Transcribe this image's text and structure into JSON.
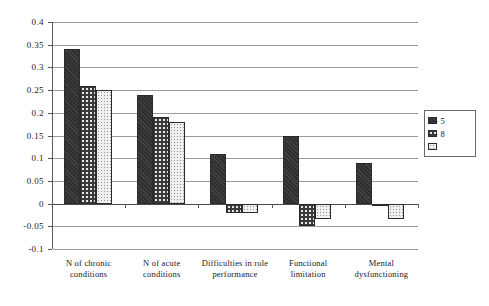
{
  "chart_data": {
    "type": "bar",
    "title": "",
    "subtitle": "",
    "xlabel": "",
    "ylabel": "",
    "ylim": [
      -0.1,
      0.4
    ],
    "yticks": [
      0.4,
      0.35,
      0.3,
      0.25,
      0.2,
      0.15,
      0.1,
      0.05,
      0,
      -0.05,
      -0.1
    ],
    "ytick_labels": [
      "0.4",
      "0.35",
      "0.3",
      "0.25",
      "0.2",
      "0.15",
      "0.1",
      "0.05",
      "0",
      "-0.05",
      "-0.1"
    ],
    "grid": true,
    "legend_position": "right",
    "categories": [
      "N of chronic conditions",
      "N of acute conditions",
      "Difficulties in role performance",
      "Functional limitation",
      "Mental dysfunctioning"
    ],
    "series": [
      {
        "name": "0 - 5",
        "pattern": "solid-dark",
        "color": "#2f2f2f",
        "values": [
          0.34,
          0.24,
          0.11,
          0.15,
          0.09
        ]
      },
      {
        "name": "6 - 8",
        "pattern": "crosshatch",
        "color": "#3a3a3a",
        "values": [
          0.26,
          0.19,
          -0.02,
          -0.05,
          -0.005
        ]
      },
      {
        "name": "9+",
        "pattern": "light-dotted",
        "color": "#f0f0f0",
        "values": [
          0.25,
          0.18,
          -0.02,
          -0.035,
          -0.035
        ]
      }
    ]
  },
  "legend": {
    "items": [
      {
        "label": "0 - 5"
      },
      {
        "label": "6 - 8"
      },
      {
        "label": "9+"
      }
    ]
  },
  "axis": {
    "y_labels": [
      "0.4",
      "0.35",
      "0.3",
      "0.25",
      "0.2",
      "0.15",
      "0.1",
      "0.05",
      "0",
      "-0.05",
      "-0.1"
    ],
    "x_labels": [
      "N of chronic conditions",
      "N of acute conditions",
      "Difficulties in role performance",
      "Functional limitation",
      "Mental dysfunctioning"
    ]
  }
}
